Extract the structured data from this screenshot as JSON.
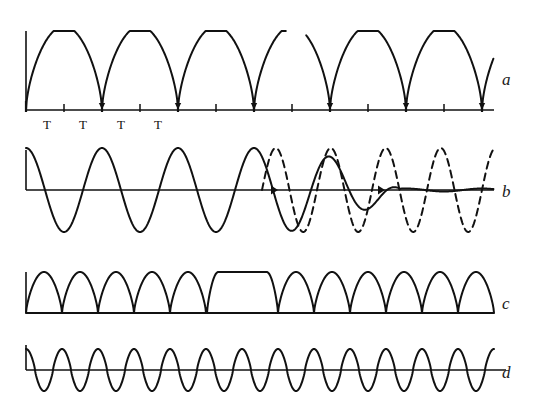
{
  "figure": {
    "background_color": "#ffffff",
    "ink_color": "#111111",
    "width": 539,
    "height": 413
  },
  "traces": [
    {
      "id": "a",
      "label": "a",
      "label_x": 502,
      "label_y": 71,
      "style": "solid",
      "description": "flat-topped rectified oscillation above baseline with tick-marked time axis",
      "baseline_y": 110,
      "axis_x": 26,
      "axis_top_y": 31,
      "amplitude": 79,
      "period": 76,
      "phase_shift": 0,
      "gap_start": 286,
      "gap_width": 20,
      "line_width": 2.0
    },
    {
      "id": "b",
      "label": "b",
      "label_x": 502,
      "label_y": 183,
      "style": "solid-and-dashed",
      "description": "full sine oscillation that damps to low amplitude while an out-of-phase dashed oscillation continues at full amplitude",
      "baseline_y": 190,
      "axis_x": 26,
      "axis_top_y": 150,
      "amplitude": 42,
      "period": 76,
      "damped_amplitude": 12,
      "damp_start_x": 270,
      "damp_end_x": 400,
      "dashed_start_x": 262,
      "dashed_period": 55,
      "dashed_amplitude": 42,
      "line_width": 2.0
    },
    {
      "id": "c",
      "label": "c",
      "label_x": 502,
      "label_y": 295,
      "style": "solid",
      "description": "train of rectified half-sine humps with one wide flat-topped plateau in the middle",
      "baseline_y": 313,
      "axis_x": 26,
      "axis_top_y": 272,
      "amplitude": 41,
      "period": 36,
      "plateau_start_x": 207,
      "plateau_end_x": 278,
      "line_width": 2.0
    },
    {
      "id": "d",
      "label": "d",
      "label_x": 502,
      "label_y": 364,
      "style": "solid",
      "description": "uniform high-frequency sine oscillation about the baseline",
      "baseline_y": 370,
      "axis_x": 26,
      "axis_top_y": 345,
      "amplitude": 21,
      "period": 36,
      "line_width": 2.0
    }
  ],
  "axis_a": {
    "tick_height_minor": 6,
    "tick_height_major": 9,
    "tick_start_x": 26,
    "tick_spacing": 38,
    "tick_count": 13,
    "arrow_at_minima": true
  },
  "t_labels": {
    "text": "T",
    "items": [
      {
        "text": "T",
        "x": 47,
        "y": 118
      },
      {
        "text": "T",
        "x": 83,
        "y": 118
      },
      {
        "text": "T",
        "x": 121,
        "y": 118
      },
      {
        "text": "T",
        "x": 158,
        "y": 118
      }
    ]
  }
}
